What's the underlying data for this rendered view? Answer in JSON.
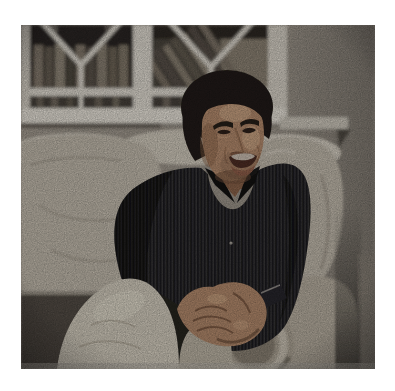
{
  "photo": {
    "alt": "A man with dark wavy hair, wearing a dark navy pinstriped button-up shirt and cream trousers, sits with hands clasped on a pale beige sofa in front of a white-framed window; blurred bookshelves are visible through the glass and the wall is textured beige wallpaper.",
    "border_color": "#ffffff"
  },
  "colors": {
    "wall": "#a49d93",
    "window_frame": "#e6e2d9",
    "window_frame_shade": "#d2cdc2",
    "glass_dark": "#332e2a",
    "books_light": "#8d8476",
    "books_mid": "#655d52",
    "sill_shadow": "#4c463f",
    "sofa": "#c6bfb2",
    "sofa_highlight": "#d9d3c7",
    "sofa_shadow": "#968e81",
    "armrest": "#bcb4a6",
    "scroll_ring": "#d0c9bb",
    "seat_dark": "#514c45",
    "shirt": "#17171a",
    "pants": "#d8d2c4",
    "pants_dark": "#c0b9aa",
    "skin": "#b68c6e",
    "skin_shadow": "#8a6248",
    "hair": "#1c1714",
    "teeth": "#e8ded2",
    "watch": "#23232a"
  }
}
